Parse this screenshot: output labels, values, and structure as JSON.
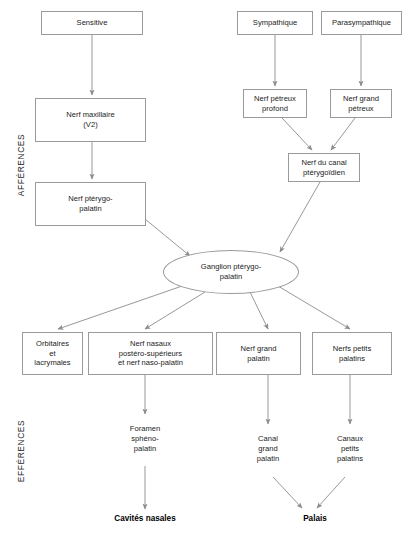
{
  "diagram": {
    "side_labels": {
      "afferences": "AFFÉRENCES",
      "efferences": "EFFÉRENCES"
    },
    "colors": {
      "box_border": "#9a9a9a",
      "arrow": "#8c8c8c",
      "text": "#1b1b1b",
      "background": "#ffffff"
    },
    "nodes": {
      "sensitive": "Sensitive",
      "sympathique": "Sympathique",
      "parasympathique": "Parasympathique",
      "nerf_maxillaire": "Nerf maxillaire\n(V2)",
      "nerf_maxillaire_line1": "Nerf maxillaire",
      "nerf_maxillaire_line2": "(V2)",
      "nerf_petreux_profond_line1": "Nerf pétreux",
      "nerf_petreux_profond_line2": "profond",
      "nerf_grand_petreux_line1": "Nerf grand",
      "nerf_grand_petreux_line2": "pétreux",
      "nerf_ptérygo_palatin_line1": "Nerf ptérygo-",
      "nerf_ptérygo_palatin_line2": "palatin",
      "nerf_canal_pterygoidien_line1": "Nerf du canal",
      "nerf_canal_pterygoidien_line2": "ptérygoïdien",
      "ganglion_line1": "Ganglion ptérygo-",
      "ganglion_line2": "palatin",
      "orbitaires_line1": "Orbitaires",
      "orbitaires_line2": "et",
      "orbitaires_line3": "lacrymales",
      "nerfs_nasaux_line1": "Nerf nasaux",
      "nerfs_nasaux_line2": "postéro-supérieurs",
      "nerfs_nasaux_line3": "et nerf naso-palatin",
      "nerf_grand_palatin_line1": "Nerf grand",
      "nerf_grand_palatin_line2": "palatin",
      "nerfs_petits_palatins_line1": "Nerfs petits",
      "nerfs_petits_palatins_line2": "palatins",
      "foramen_spheno_line1": "Foramen",
      "foramen_spheno_line2": "sphéno-",
      "foramen_spheno_line3": "palatin",
      "canal_grand_palatin_line1": "Canal",
      "canal_grand_palatin_line2": "grand",
      "canal_grand_palatin_line3": "palatin",
      "canaux_petits_palatins_line1": "Canaux",
      "canaux_petits_palatins_line2": "petits",
      "canaux_petits_palatins_line3": "palatins",
      "cavites_nasales": "Cavités nasales",
      "palais": "Palais"
    }
  }
}
